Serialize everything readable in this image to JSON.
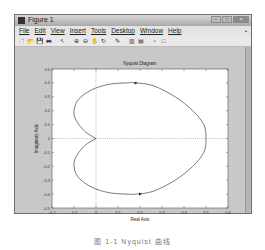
{
  "window": {
    "title": "Figure 1",
    "buttons": [
      "minimize",
      "maximize",
      "close"
    ]
  },
  "menubar": {
    "items": [
      "File",
      "Edit",
      "View",
      "Insert",
      "Tools",
      "Desktop",
      "Window",
      "Help"
    ],
    "pin": "▪"
  },
  "toolbar": {
    "icons": [
      "new-file-icon",
      "open-icon",
      "save-icon",
      "print-icon",
      "pointer-icon",
      "zoom-in-icon",
      "zoom-out-icon",
      "pan-icon",
      "rotate-icon",
      "data-cursor-icon",
      "colorbar-icon",
      "legend-icon",
      "hide-plot-tools-icon",
      "show-plot-tools-icon"
    ],
    "glyphs": [
      "🗋",
      "📂",
      "💾",
      "🖶",
      "↖",
      "⊕",
      "⊖",
      "✋",
      "↻",
      "✎",
      "▥",
      "▤",
      "▫",
      "□"
    ]
  },
  "chart_data": {
    "type": "line",
    "title": "Nyquist Diagram",
    "xlabel": "Real Axis",
    "ylabel": "Imaginary Axis",
    "xlim": [
      -0.2,
      0.6
    ],
    "ylim": [
      -0.5,
      0.5
    ],
    "xticks": [
      -0.2,
      -0.1,
      0,
      0.1,
      0.2,
      0.3,
      0.4,
      0.5,
      0.6
    ],
    "yticks": [
      0.5,
      0.4,
      0.3,
      0.2,
      0.1,
      0,
      -0.1,
      -0.2,
      -0.3,
      -0.4,
      -0.5
    ],
    "xtick_labels": [
      "-0.2",
      "-0.1",
      "0",
      "0.1",
      "0.2",
      "0.3",
      "0.4",
      "0.5",
      "0.6"
    ],
    "ytick_labels": [
      "0.5",
      "0.4",
      "0.3",
      "0.2",
      "0.1",
      "0",
      "-0.1",
      "-0.2",
      "-0.3",
      "-0.4",
      "-0.5"
    ],
    "grid": false,
    "reference_lines": {
      "x": 0,
      "y": 0,
      "style": "dotted"
    },
    "series": [
      {
        "name": "Nyquist curve",
        "x": [
          0,
          -0.05,
          -0.09,
          -0.1,
          -0.08,
          -0.02,
          0.06,
          0.14,
          0.18,
          0.26,
          0.36,
          0.44,
          0.49,
          0.5,
          0.49,
          0.44,
          0.36,
          0.26,
          0.18,
          0.14,
          0.06,
          -0.02,
          -0.08,
          -0.1,
          -0.09,
          -0.05,
          0
        ],
        "y": [
          0,
          0.05,
          0.13,
          0.2,
          0.28,
          0.35,
          0.39,
          0.4,
          0.4,
          0.38,
          0.3,
          0.2,
          0.1,
          0,
          -0.1,
          -0.2,
          -0.3,
          -0.38,
          -0.4,
          -0.4,
          -0.39,
          -0.35,
          -0.28,
          -0.2,
          -0.13,
          -0.05,
          0
        ]
      }
    ],
    "arrows": [
      {
        "x": 0.18,
        "y": 0.4
      },
      {
        "x": 0.2,
        "y": -0.4
      }
    ]
  },
  "caption": "图 1-1 Nyquist 曲线"
}
